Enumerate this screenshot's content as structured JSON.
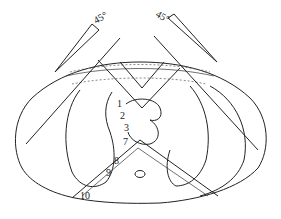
{
  "diagram": {
    "type": "cross-section anatomical diagram",
    "angle_markers": [
      {
        "id": "left",
        "label": "45°"
      },
      {
        "id": "right",
        "label": "45°"
      }
    ],
    "labels": [
      {
        "id": "1",
        "text": "1"
      },
      {
        "id": "2",
        "text": "2"
      },
      {
        "id": "3",
        "text": "3"
      },
      {
        "id": "7",
        "text": "7"
      },
      {
        "id": "8",
        "text": "8"
      },
      {
        "id": "9",
        "text": "9"
      },
      {
        "id": "10",
        "text": "10"
      }
    ]
  }
}
